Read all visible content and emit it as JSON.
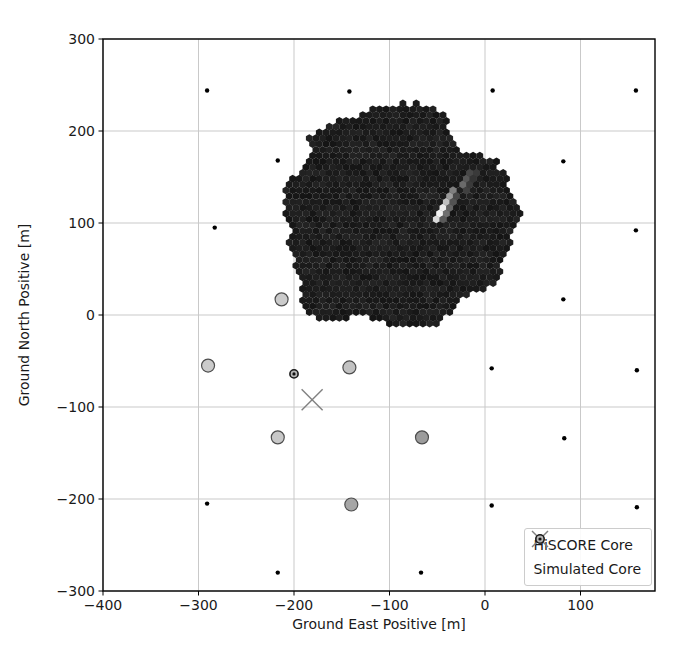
{
  "figure": {
    "width": 686,
    "height": 659,
    "background": "#ffffff"
  },
  "legend": {
    "items": [
      {
        "label": "HiSCORE Core",
        "marker": "x-marker",
        "color": "#808080"
      },
      {
        "label": "Simulated Core",
        "marker": "ring-dot-marker",
        "edge_color": "#1a1a1a",
        "fill": "#b5b5b5"
      }
    ]
  },
  "chart_data": {
    "type": "scatter",
    "title": "",
    "xlabel": "Ground East Positive [m]",
    "ylabel": "Ground North Positive [m]",
    "xlim": [
      -400,
      178
    ],
    "ylim": [
      -300,
      300
    ],
    "xticks": [
      -400,
      -300,
      -200,
      -100,
      0,
      100
    ],
    "yticks": [
      300,
      200,
      100,
      0,
      -100,
      -200,
      -300
    ],
    "grid": true,
    "grid_color": "#c9c9c9",
    "border_color": "#000000",
    "legend_position": "lower right",
    "series": [
      {
        "name": "array-stations",
        "marker": "point",
        "color": "#000000",
        "size_px": 4.4,
        "points": [
          [
            -291,
            244
          ],
          [
            -142,
            243
          ],
          [
            8,
            244
          ],
          [
            158,
            244
          ],
          [
            -217,
            168
          ],
          [
            82,
            167
          ],
          [
            -283,
            95
          ],
          [
            158,
            92
          ],
          [
            82,
            17
          ],
          [
            7,
            -58
          ],
          [
            159,
            -60
          ],
          [
            83,
            -134
          ],
          [
            -291,
            -205
          ],
          [
            7,
            -207
          ],
          [
            159,
            -209
          ],
          [
            -217,
            -280
          ],
          [
            -67,
            -280
          ]
        ]
      },
      {
        "name": "triggered-stations",
        "marker": "circle",
        "edge_color": "#4d4d4d",
        "size_px": 13,
        "points": [
          {
            "x": -213,
            "y": 17,
            "fill": "#cbcbcb"
          },
          {
            "x": -290,
            "y": -55,
            "fill": "#cbcbcb"
          },
          {
            "x": -142,
            "y": -57,
            "fill": "#c2c2c2"
          },
          {
            "x": -217,
            "y": -133,
            "fill": "#c8c8c8"
          },
          {
            "x": -66,
            "y": -133,
            "fill": "#9c9c9c"
          },
          {
            "x": -140,
            "y": -206,
            "fill": "#a6a6a6"
          }
        ]
      },
      {
        "name": "shower-footprint",
        "marker": "hex-cluster",
        "center": [
          -93,
          104
        ],
        "radius_m": 120,
        "hex_pitch_m": 7,
        "base_gray": 20,
        "gray_jitter": 16,
        "lumpiness": [
          [
            3,
            0.05,
            0.9
          ],
          [
            5,
            0.045,
            2.2
          ],
          [
            7,
            0.04,
            4.4
          ],
          [
            11,
            0.025,
            1.6
          ]
        ]
      },
      {
        "name": "shower-axis-streak",
        "marker": "hex",
        "points": [
          {
            "x": -53,
            "y": 101,
            "fill": "#d9d9d9"
          },
          {
            "x": -49,
            "y": 109,
            "fill": "#f2f2f2"
          },
          {
            "x": -45,
            "y": 117,
            "fill": "#ececec"
          },
          {
            "x": -41,
            "y": 124,
            "fill": "#bfbfbf"
          },
          {
            "x": -36,
            "y": 130,
            "fill": "#9b9b9b"
          },
          {
            "x": -31,
            "y": 136,
            "fill": "#7f7f7f"
          },
          {
            "x": -26,
            "y": 141,
            "fill": "#6a6a6a"
          },
          {
            "x": -21,
            "y": 147,
            "fill": "#575757"
          },
          {
            "x": -16,
            "y": 152,
            "fill": "#474747"
          },
          {
            "x": -11,
            "y": 157,
            "fill": "#3a3a3a"
          },
          {
            "x": -47,
            "y": 104,
            "fill": "#5a5a5a"
          },
          {
            "x": -43,
            "y": 111,
            "fill": "#6f6f6f"
          },
          {
            "x": -38,
            "y": 118,
            "fill": "#636363"
          },
          {
            "x": -33,
            "y": 124,
            "fill": "#525252"
          },
          {
            "x": -28,
            "y": 130,
            "fill": "#484848"
          },
          {
            "x": -23,
            "y": 136,
            "fill": "#404040"
          },
          {
            "x": -18,
            "y": 141,
            "fill": "#3a3a3a"
          },
          {
            "x": -13,
            "y": 147,
            "fill": "#343434"
          }
        ]
      },
      {
        "name": "hiscore-core",
        "marker": "x",
        "color": "#808080",
        "size_px": 21,
        "points": [
          [
            -181,
            -92
          ]
        ]
      },
      {
        "name": "simulated-core",
        "marker": "ring-dot",
        "edge_color": "#1a1a1a",
        "fill": "#b5b5b5",
        "dot_color": "#111111",
        "size_px": 9,
        "points": [
          [
            -200,
            -64
          ]
        ]
      }
    ]
  }
}
